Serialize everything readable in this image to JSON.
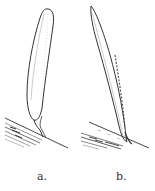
{
  "figure": {
    "type": "botanical line illustration",
    "stroke_color": "#333333",
    "background": "#ffffff",
    "panels": [
      {
        "label": "a.",
        "description": "broad oblong leaf blade with rounded tip, attached by a short curved stalk to a diagonal stem"
      },
      {
        "label": "b.",
        "description": "narrow lanceolate leaf blade with pointed tip, tapering into a diagonal stem"
      }
    ]
  }
}
